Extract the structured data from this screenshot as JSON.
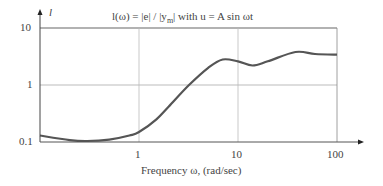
{
  "chart_data": {
    "type": "line",
    "xlabel": "Frequency ω, (rad/sec)",
    "ylabel": "l",
    "xscale": "log",
    "yscale": "log",
    "xlim": [
      0.1,
      100
    ],
    "ylim": [
      0.1,
      10
    ],
    "x_ticks": [
      "1",
      "10",
      "100"
    ],
    "y_ticks": [
      "0.1",
      "1",
      "10"
    ],
    "grid": true,
    "series": [
      {
        "name": "l(ω)",
        "x": [
          0.1,
          0.2,
          0.3,
          0.5,
          0.8,
          1.0,
          1.5,
          2.0,
          3.2,
          5.0,
          7.0,
          10,
          14,
          20,
          38,
          60,
          100
        ],
        "values": [
          0.13,
          0.108,
          0.104,
          0.11,
          0.13,
          0.15,
          0.25,
          0.42,
          1.0,
          2.0,
          2.8,
          2.6,
          2.2,
          2.6,
          3.8,
          3.5,
          3.4
        ]
      }
    ]
  },
  "labels": {
    "title_prefix": "l(ω) = |e| / |y",
    "title_sub": "m",
    "title_suffix": "| with u = A sin ωt",
    "ylabel": "l",
    "xlabel": "Frequency ω, (rad/sec)",
    "y_ticks": [
      "10",
      "1",
      "0.1"
    ],
    "x_ticks": [
      "1",
      "10",
      "100"
    ]
  }
}
